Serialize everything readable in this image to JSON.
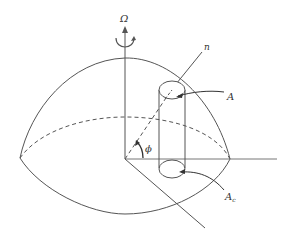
{
  "figure": {
    "type": "hemisphere-geometry-diagram",
    "labels": {
      "rotation_axis": "Ω",
      "normal": "n",
      "top_area": "A",
      "bottom_area": "A",
      "bottom_area_subscript": "c",
      "angle": "ϕ"
    },
    "colors": {
      "stroke": "#555555",
      "text": "#333333",
      "background": "#ffffff"
    }
  }
}
